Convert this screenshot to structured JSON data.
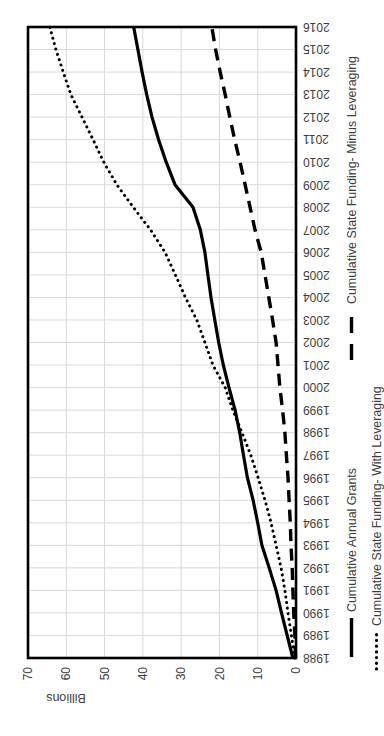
{
  "page": {
    "background": "#ffffff"
  },
  "chart_data": {
    "type": "line",
    "title": "",
    "xlabel": "",
    "ylabel": "Billions",
    "display_units_label": "Billions",
    "grid": true,
    "legend_position": "bottom",
    "ylim": [
      0,
      70
    ],
    "y_tick_interval": 10,
    "y_ticks": [
      0,
      10,
      20,
      30,
      40,
      50,
      60,
      70
    ],
    "categories": [
      "1988",
      "1989",
      "1990",
      "1991",
      "1992",
      "1993",
      "1994",
      "1995",
      "1996",
      "1997",
      "1998",
      "1999",
      "2000",
      "2001",
      "2002",
      "2003",
      "2004",
      "2005",
      "2006",
      "2007",
      "2008",
      "2009",
      "2010",
      "2011",
      "2012",
      "2013",
      "2014",
      "2015",
      "2016"
    ],
    "series": [
      {
        "name": "Cumulative Annual Grants",
        "line_style": "solid",
        "color": "#000000",
        "values": [
          0.8,
          2.3,
          3.8,
          5.2,
          7.0,
          8.9,
          10.0,
          11.2,
          12.7,
          13.7,
          14.7,
          15.9,
          17.5,
          19.0,
          20.2,
          21.2,
          22.2,
          23.0,
          23.8,
          25.0,
          26.9,
          31.6,
          33.9,
          35.9,
          37.6,
          39.0,
          40.2,
          41.3,
          42.4
        ]
      },
      {
        "name": "Cumulative State Funding- Minus Leveraging",
        "line_style": "dashed",
        "color": "#000000",
        "values": [
          0.1,
          0.3,
          0.6,
          0.8,
          1.0,
          1.3,
          1.5,
          1.8,
          2.1,
          2.5,
          2.9,
          3.5,
          4.2,
          4.7,
          5.2,
          6.1,
          7.1,
          8.1,
          9.1,
          10.7,
          12.0,
          13.3,
          14.6,
          16.0,
          17.3,
          18.5,
          19.8,
          21.0,
          22.0
        ]
      },
      {
        "name": "Cumulative State Funding- With Leveraging",
        "line_style": "dotted",
        "color": "#000000",
        "values": [
          0.3,
          1.2,
          2.1,
          2.9,
          3.9,
          5.2,
          6.5,
          8.1,
          9.9,
          11.8,
          14.1,
          16.5,
          18.5,
          21.7,
          23.8,
          25.9,
          28.9,
          31.5,
          34.2,
          38.0,
          42.5,
          46.8,
          50.2,
          53.0,
          55.9,
          58.8,
          60.8,
          62.7,
          64.3
        ]
      }
    ],
    "legend_rows": [
      [
        0,
        1
      ],
      [
        2
      ]
    ],
    "colors": {
      "line": "#000000",
      "gridline": "#d9d9d9",
      "frame": "#000000",
      "tick_text": "#3d3d3d"
    }
  }
}
